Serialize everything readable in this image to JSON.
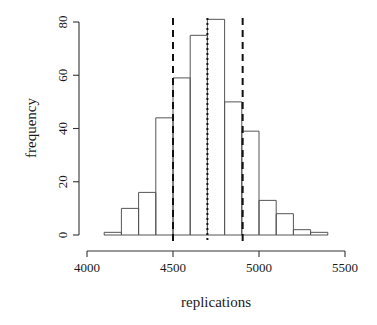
{
  "chart_data": {
    "type": "bar",
    "title": "",
    "subtitle": "",
    "xlabel": "replications",
    "ylabel": "frequency",
    "xlim": [
      4000,
      5500
    ],
    "ylim": [
      0,
      84
    ],
    "grid": false,
    "legend": "none",
    "x_ticks": [
      4000,
      4500,
      5000,
      5500
    ],
    "x_tick_labels": [
      "4000",
      "4500",
      "5000",
      "5500"
    ],
    "y_ticks": [
      0,
      20,
      40,
      60,
      80
    ],
    "y_tick_labels": [
      "0",
      "20",
      "40",
      "60",
      "80"
    ],
    "bin_width": 100,
    "bin_edges": [
      4100,
      4200,
      4300,
      4400,
      4500,
      4600,
      4700,
      4800,
      4900,
      5000,
      5100,
      5200,
      5300,
      5400
    ],
    "categories": [
      "4100-4200",
      "4200-4300",
      "4300-4400",
      "4400-4500",
      "4500-4600",
      "4600-4700",
      "4700-4800",
      "4800-4900",
      "4900-5000",
      "5000-5100",
      "5100-5200",
      "5200-5300",
      "5300-5400"
    ],
    "values": [
      1,
      10,
      16,
      44,
      59,
      75,
      81,
      50,
      39,
      13,
      8,
      2,
      1
    ],
    "annotations": [
      {
        "name": "lower-reference-line",
        "style": "dashed",
        "x": 4500
      },
      {
        "name": "center-reference-line",
        "style": "dotted",
        "x": 4700
      },
      {
        "name": "upper-reference-line",
        "style": "dashed",
        "x": 4905
      }
    ]
  }
}
